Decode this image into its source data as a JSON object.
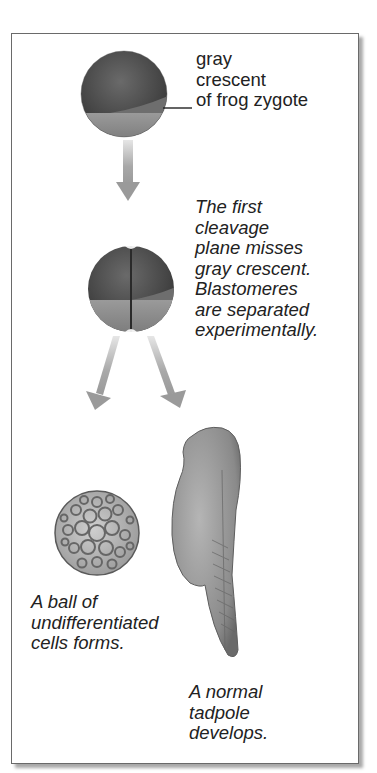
{
  "figure": {
    "stages": [
      {
        "id": "zygote",
        "label_lines": [
          "gray",
          "crescent",
          "of frog zygote"
        ]
      },
      {
        "id": "first-cleavage",
        "label_lines": [
          "The first",
          "cleavage",
          "plane misses",
          "gray crescent.",
          "Blastomeres",
          "are separated",
          "experimentally."
        ]
      },
      {
        "id": "ball-of-cells",
        "label_lines": [
          "A ball of",
          "undifferentiated",
          "cells forms."
        ]
      },
      {
        "id": "normal-tadpole",
        "label_lines": [
          "A normal",
          "tadpole",
          "develops."
        ]
      }
    ],
    "labels": {
      "zygote": "gray\ncrescent\nof frog zygote",
      "cleavage": "The first\ncleavage\nplane misses\ngray crescent.\nBlastomeres\nare separated\nexperimentally.",
      "ball": "A ball of\nundifferentiated\ncells forms.",
      "tadpole": "A normal\ntadpole\ndevelops."
    },
    "colors": {
      "animal_pole": "#4a4a4a",
      "vegetal_pole": "#8e8e8e",
      "gray_crescent": "#6e6e6e",
      "arrow": "#9a9a9a",
      "frame_border": "#6a6a6a",
      "text": "#222222"
    }
  }
}
